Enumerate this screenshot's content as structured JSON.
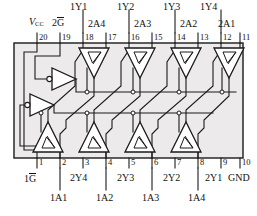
{
  "diagram": {
    "kind": "ic-logic-diagram",
    "device": "octal tri-state buffer (74x244 style)",
    "colors": {
      "line": "#1a1a1a",
      "body_fill": "#eceaea",
      "background": "#ffffff",
      "junction": "#ffffff"
    },
    "body": {
      "x": 14,
      "y": 43,
      "width": 229,
      "height": 115
    }
  },
  "top_pins": [
    {
      "number": "20",
      "x": 37
    },
    {
      "number": "19",
      "x": 60
    },
    {
      "number": "18",
      "x": 83
    },
    {
      "number": "17",
      "x": 106
    },
    {
      "number": "16",
      "x": 129
    },
    {
      "number": "15",
      "x": 152
    },
    {
      "number": "14",
      "x": 175
    },
    {
      "number": "13",
      "x": 198
    },
    {
      "number": "12",
      "x": 221
    },
    {
      "number": "11",
      "x": 240
    }
  ],
  "bottom_pins": [
    {
      "number": "1",
      "x": 37
    },
    {
      "number": "2",
      "x": 60
    },
    {
      "number": "3",
      "x": 83
    },
    {
      "number": "4",
      "x": 106
    },
    {
      "number": "5",
      "x": 129
    },
    {
      "number": "6",
      "x": 152
    },
    {
      "number": "7",
      "x": 175
    },
    {
      "number": "8",
      "x": 198
    },
    {
      "number": "9",
      "x": 221
    },
    {
      "number": "10",
      "x": 240
    }
  ],
  "top_labels_row1": [
    {
      "text": "1Y1",
      "x": 70,
      "y": 2
    },
    {
      "text": "1Y2",
      "x": 117,
      "y": 2
    },
    {
      "text": "1Y3",
      "x": 163,
      "y": 2
    },
    {
      "text": "1Y4",
      "x": 200,
      "y": 2
    }
  ],
  "top_labels_row2": [
    {
      "text": "2A4",
      "x": 88,
      "y": 19
    },
    {
      "text": "2A3",
      "x": 134,
      "y": 19
    },
    {
      "text": "2A2",
      "x": 180,
      "y": 19
    },
    {
      "text": "2A1",
      "x": 218,
      "y": 19
    }
  ],
  "power_labels": {
    "vcc": {
      "main": "V",
      "sub": "CC",
      "x": 29,
      "y": 17
    },
    "g2": {
      "prefix": "2",
      "bar": "G",
      "x": 52,
      "y": 17
    }
  },
  "bottom_labels_row1": [
    {
      "text": "2Y4",
      "x": 70,
      "y": 173
    },
    {
      "text": "2Y3",
      "x": 117,
      "y": 173
    },
    {
      "text": "2Y2",
      "x": 163,
      "y": 173
    },
    {
      "text": "2Y1",
      "x": 205,
      "y": 173
    },
    {
      "text": "GND",
      "x": 228,
      "y": 173
    }
  ],
  "bottom_labels_row2": [
    {
      "text": "1A1",
      "x": 50,
      "y": 193
    },
    {
      "text": "1A2",
      "x": 96,
      "y": 193
    },
    {
      "text": "1A3",
      "x": 142,
      "y": 193
    },
    {
      "text": "1A4",
      "x": 188,
      "y": 193
    }
  ],
  "enable_label": {
    "prefix": "1",
    "bar": "G",
    "x": 24,
    "y": 173
  },
  "buffers": {
    "top_row": [
      {
        "name": "buffer-2a4",
        "cx": 94
      },
      {
        "name": "buffer-2a3",
        "cx": 140
      },
      {
        "name": "buffer-2a2",
        "cx": 186
      },
      {
        "name": "buffer-2a1",
        "cx": 229
      }
    ],
    "bottom_row": [
      {
        "name": "buffer-1a1",
        "cx": 48
      },
      {
        "name": "buffer-1a2",
        "cx": 94
      },
      {
        "name": "buffer-1a3",
        "cx": 140
      },
      {
        "name": "buffer-1a4",
        "cx": 186
      }
    ],
    "inverters": [
      {
        "name": "inverter-2g",
        "x": 52,
        "y": 79
      },
      {
        "name": "inverter-1g",
        "x": 30,
        "y": 105
      }
    ]
  }
}
